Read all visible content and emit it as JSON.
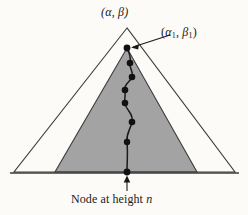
{
  "figure": {
    "type": "diagram",
    "caption_labels": {
      "apex_label": "(α, β)",
      "subtree_apex_label_open": "(",
      "subtree_alpha": "α",
      "subtree_alpha_sub": "1",
      "subtree_sep": ", ",
      "subtree_beta": "β",
      "subtree_beta_sub": "1",
      "subtree_close": ")",
      "bottom_caption_text": "Node at height ",
      "bottom_caption_italic": "n"
    },
    "colors": {
      "background": "#fcfbf7",
      "shaded_triangle_fill": "#a3a3a3",
      "outline_stroke": "#3c3c3c",
      "path_stroke": "#1a1a1a",
      "node_fill": "#111111",
      "text": "#1a1a1a"
    },
    "geometry": {
      "outer_triangle": {
        "apex": [
          127,
          28
        ],
        "base_left": [
          14,
          172
        ],
        "base_right": [
          235,
          172
        ]
      },
      "inner_triangle": {
        "apex": [
          127,
          48
        ],
        "base_left": [
          55,
          172
        ],
        "base_right": [
          197,
          172
        ]
      },
      "baseline": {
        "from": [
          10,
          173
        ],
        "to": [
          239,
          173
        ]
      },
      "node_points": [
        [
          127,
          48
        ],
        [
          130,
          63
        ],
        [
          132,
          77
        ],
        [
          125,
          90
        ],
        [
          125,
          103
        ],
        [
          132,
          122
        ],
        [
          127,
          142
        ],
        [
          127,
          172
        ]
      ],
      "arrow_to_subtree_apex": {
        "from": [
          170,
          35
        ],
        "to": [
          131,
          47
        ]
      },
      "arrow_to_bottom_node": {
        "from": [
          127,
          191
        ],
        "to": [
          127,
          176
        ]
      }
    }
  }
}
